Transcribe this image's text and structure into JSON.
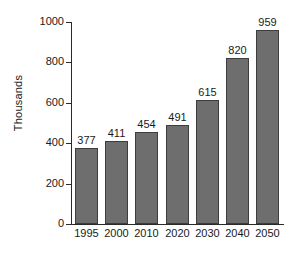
{
  "chart_data": {
    "type": "bar",
    "title": "",
    "xlabel": "",
    "ylabel": "Thousands",
    "categories": [
      "1995",
      "2000",
      "2010",
      "2020",
      "2030",
      "2040",
      "2050"
    ],
    "values": [
      377,
      411,
      454,
      491,
      615,
      820,
      959
    ],
    "value_labels": [
      "377",
      "411",
      "454",
      "491",
      "615",
      "820",
      "959"
    ],
    "ylim": [
      0,
      1000
    ],
    "y_ticks": [
      0,
      200,
      400,
      600,
      800,
      1000
    ],
    "y_tick_labels": [
      "0",
      "200",
      "400",
      "600",
      "800",
      "1000"
    ],
    "grid": false,
    "legend": null,
    "series": [
      {
        "name": "",
        "values": [
          377,
          411,
          454,
          491,
          615,
          820,
          959
        ]
      }
    ],
    "colors": {
      "bar_fill": "#6e6e6e",
      "bar_border": "#3d3d3d",
      "axis": "#2a2a2a",
      "text": "#1a1a1a",
      "background": "#ffffff"
    }
  }
}
